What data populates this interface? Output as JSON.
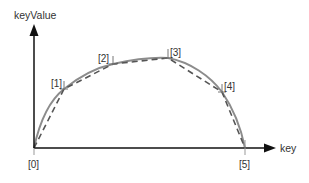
{
  "diagram": {
    "y_axis_label": "keyValue",
    "x_axis_label": "key",
    "points": [
      {
        "label": "[0]",
        "x": 34,
        "y": 148
      },
      {
        "label": "[1]",
        "x": 64,
        "y": 89
      },
      {
        "label": "[2]",
        "x": 113,
        "y": 64
      },
      {
        "label": "[3]",
        "x": 168,
        "y": 58
      },
      {
        "label": "[4]",
        "x": 222,
        "y": 92
      },
      {
        "label": "[5]",
        "x": 245,
        "y": 148
      }
    ],
    "curves": {
      "smooth": {
        "style": "solid",
        "color": "#888888"
      },
      "linear": {
        "style": "dashed",
        "color": "#555555"
      }
    },
    "colors": {
      "axis": "#111111",
      "text": "#333333"
    }
  }
}
